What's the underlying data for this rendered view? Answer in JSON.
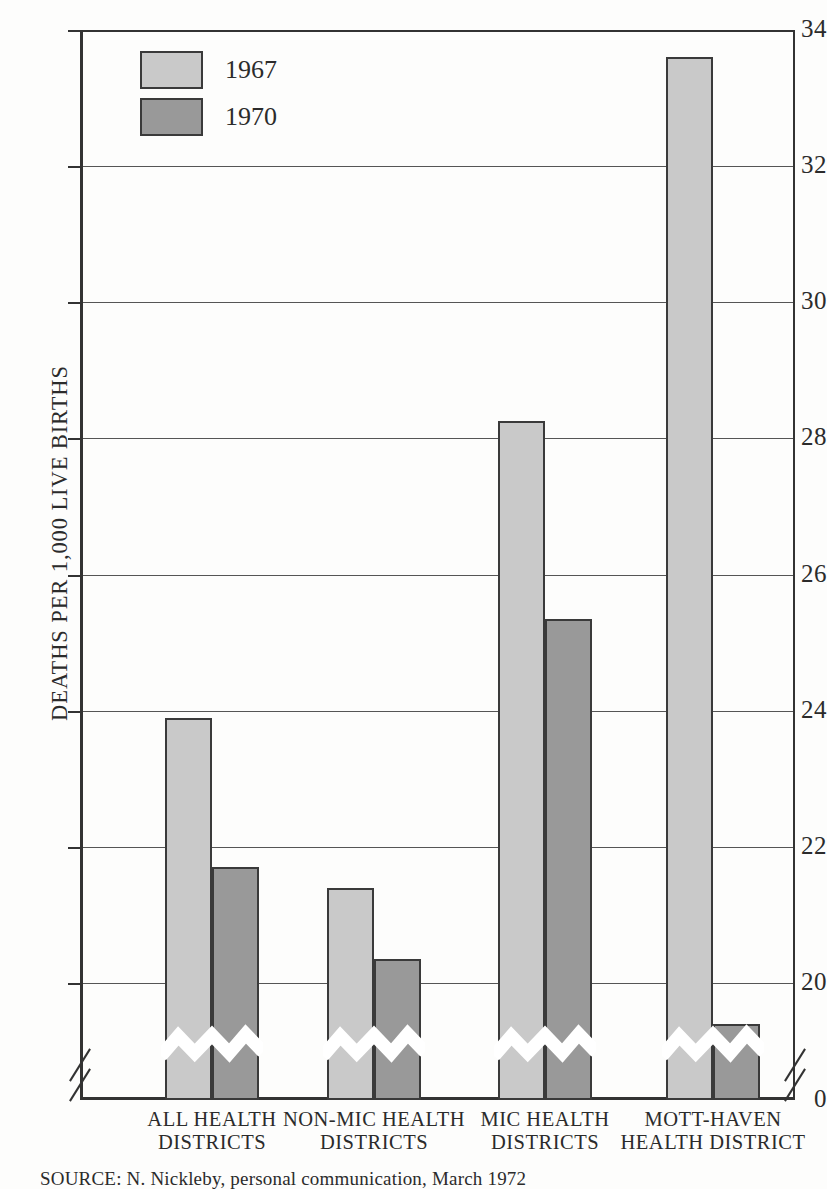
{
  "chart_data": {
    "type": "bar",
    "title": "",
    "xlabel": "",
    "ylabel": "DEATHS PER 1,000 LIVE BIRTHS",
    "ylim": [
      0,
      34
    ],
    "y_axis_break": true,
    "y_axis_break_note": "axis broken between 0 and ~19",
    "grid": true,
    "legend_position": "top-left inside plot",
    "yticks": [
      {
        "value": 34,
        "label": "34"
      },
      {
        "value": 32,
        "label": "32"
      },
      {
        "value": 30,
        "label": "30"
      },
      {
        "value": 28,
        "label": "28"
      },
      {
        "value": 26,
        "label": "26"
      },
      {
        "value": 24,
        "label": "24"
      },
      {
        "value": 22,
        "label": "22"
      },
      {
        "value": 20,
        "label": "20"
      },
      {
        "value": 0,
        "label": "0"
      }
    ],
    "categories": [
      "ALL HEALTH\nDISTRICTS",
      "NON-MIC HEALTH\nDISTRICTS",
      "MIC HEALTH\nDISTRICTS",
      "MOTT-HAVEN\nHEALTH DISTRICT"
    ],
    "series": [
      {
        "name": "1967",
        "color": "#c9c9c9",
        "values": [
          23.9,
          21.4,
          28.25,
          33.6
        ]
      },
      {
        "name": "1970",
        "color": "#999999",
        "values": [
          21.7,
          20.35,
          25.35,
          19.4
        ]
      }
    ]
  },
  "legend": {
    "items": [
      {
        "label": "1967",
        "color": "#c9c9c9"
      },
      {
        "label": "1970",
        "color": "#999999"
      }
    ]
  },
  "axis": {
    "y_title": "DEATHS PER 1,000 LIVE BIRTHS"
  },
  "source": {
    "text": "SOURCE: N. Nickleby, personal communication, March 1972"
  }
}
